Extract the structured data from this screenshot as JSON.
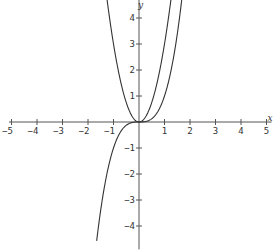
{
  "chart_data": {
    "type": "line",
    "title": "",
    "xlabel": "x",
    "ylabel": "y",
    "xlim": [
      -5.1,
      5.2
    ],
    "ylim": [
      -4.9,
      4.8
    ],
    "grid": false,
    "legend": null,
    "x_ticks": [
      -5,
      -4,
      -3,
      -2,
      -1,
      1,
      2,
      3,
      4,
      5
    ],
    "y_ticks": [
      -4,
      -3,
      -2,
      -1,
      1,
      2,
      3,
      4
    ],
    "series": [
      {
        "name": "y = 3x^2",
        "expression": "3*x^2",
        "x_range": [
          -1.26,
          1.26
        ],
        "color": "#333333"
      },
      {
        "name": "y = x^3",
        "expression": "x^3",
        "x_range": [
          -1.66,
          1.69
        ],
        "color": "#333333"
      }
    ]
  },
  "layout": {
    "origin_px": [
      139,
      122
    ],
    "unit_x_px": 25.5,
    "unit_y_px": 26,
    "axis_color": "#555555",
    "curve_color": "#333333"
  }
}
